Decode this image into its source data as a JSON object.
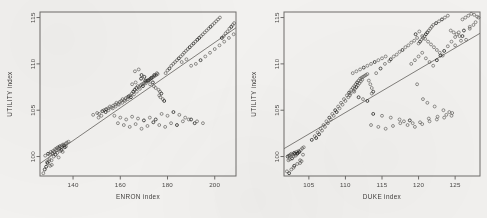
{
  "figure": {
    "background_color": "#f2f1ef",
    "point_color": "#55534f",
    "line_color": "#63615d",
    "axis_color": "#6e6c6a",
    "panel_count": 2
  },
  "chart_data": [
    {
      "type": "scatter",
      "panel": "left",
      "title": "",
      "xlabel": "ENRON index",
      "ylabel": "UTILITY index",
      "xlim": [
        126,
        209
      ],
      "ylim": [
        97.9,
        115.6
      ],
      "xticks": [
        140,
        160,
        180,
        200
      ],
      "xticklabels": [
        "140",
        "160",
        "180",
        "200"
      ],
      "yticks": [
        100,
        105,
        110,
        115
      ],
      "yticklabels": [
        "100",
        "105",
        "110",
        "115"
      ],
      "grid": false,
      "legend": "none",
      "annotations": [],
      "fit_line": {
        "x": [
          126,
          209
        ],
        "y": [
          99.25,
          113.9
        ]
      },
      "x": [
        128.2,
        129.4,
        130.1,
        130.6,
        131.2,
        131.5,
        132.0,
        132.4,
        132.8,
        133.1,
        133.6,
        134.0,
        134.4,
        134.9,
        135.3,
        135.8,
        136.2,
        136.9,
        137.4,
        138.1,
        129.0,
        129.8,
        130.9,
        131.8,
        132.6,
        133.3,
        134.6,
        135.1,
        136.5,
        137.0,
        128.6,
        130.3,
        131.0,
        133.9,
        135.6,
        127.4,
        128.0,
        129.2,
        130.0,
        131.4,
        148.5,
        150.2,
        151.0,
        152.4,
        153.1,
        154.0,
        154.8,
        155.6,
        156.2,
        157.0,
        157.8,
        158.4,
        159.1,
        159.8,
        160.4,
        161.0,
        161.7,
        162.3,
        163.0,
        163.6,
        150.8,
        152.0,
        153.8,
        155.0,
        156.8,
        158.0,
        159.4,
        160.8,
        162.0,
        163.2,
        164.2,
        164.9,
        165.5,
        166.1,
        166.8,
        167.4,
        168.0,
        168.6,
        169.2,
        169.9,
        170.4,
        171.0,
        171.6,
        172.2,
        172.8,
        173.4,
        174.0,
        174.6,
        175.2,
        175.8,
        164.5,
        165.8,
        167.0,
        168.3,
        169.6,
        170.8,
        172.0,
        173.2,
        174.4,
        175.5,
        165.0,
        166.5,
        168.8,
        170.2,
        171.4,
        173.8,
        175.0,
        176.2,
        176.8,
        177.4,
        166.2,
        167.8,
        169.0,
        170.6,
        172.6,
        174.2,
        176.5,
        177.0,
        178.0,
        178.6,
        179.2,
        180.0,
        180.8,
        181.6,
        182.4,
        183.2,
        184.0,
        184.8,
        185.6,
        186.4,
        187.0,
        187.8,
        188.6,
        189.4,
        190.2,
        191.0,
        191.8,
        192.6,
        193.4,
        194.2,
        195.0,
        195.8,
        196.6,
        197.4,
        198.2,
        199.0,
        199.8,
        200.6,
        201.4,
        202.2,
        203.0,
        203.8,
        204.6,
        205.4,
        206.2,
        207.0,
        207.6,
        208.2,
        186.0,
        188.0,
        190.0,
        192.0,
        194.0,
        196.0,
        198.0,
        200.0,
        202.0,
        204.0,
        206.0,
        208.0,
        159.0,
        161.5,
        164.0,
        166.5,
        169.0,
        171.5,
        174.0,
        176.5,
        179.0,
        181.5,
        184.0,
        186.5,
        189.0,
        191.5,
        157.5,
        160.0,
        162.5,
        165.0,
        167.5,
        170.0,
        172.5,
        175.0,
        177.5,
        180.0,
        182.5,
        185.0,
        187.5,
        190.0,
        192.5,
        195.0
      ],
      "y": [
        100.1,
        100.3,
        100.2,
        100.5,
        100.4,
        100.6,
        100.5,
        100.8,
        100.7,
        100.9,
        101.0,
        100.9,
        101.1,
        101.0,
        101.2,
        101.3,
        101.2,
        101.4,
        101.5,
        101.6,
        99.4,
        99.5,
        99.6,
        100.0,
        100.2,
        100.4,
        100.6,
        100.7,
        101.0,
        101.1,
        98.9,
        99.0,
        99.1,
        99.9,
        100.5,
        98.2,
        98.6,
        99.3,
        99.7,
        100.3,
        104.5,
        104.7,
        104.6,
        104.9,
        105.0,
        105.1,
        105.2,
        105.4,
        105.3,
        105.5,
        105.6,
        105.8,
        105.7,
        105.9,
        106.0,
        106.2,
        106.1,
        106.3,
        106.4,
        106.5,
        104.2,
        104.4,
        104.8,
        105.0,
        105.2,
        105.4,
        105.6,
        105.8,
        106.0,
        106.2,
        106.6,
        106.8,
        107.0,
        107.2,
        107.4,
        107.6,
        107.5,
        107.7,
        107.8,
        107.9,
        108.0,
        108.1,
        108.2,
        108.3,
        108.4,
        108.5,
        108.6,
        108.7,
        108.8,
        108.9,
        106.4,
        106.7,
        107.0,
        107.3,
        107.6,
        107.9,
        108.2,
        108.5,
        108.8,
        109.0,
        107.8,
        108.0,
        108.4,
        108.6,
        108.2,
        108.0,
        107.4,
        107.2,
        107.0,
        106.8,
        109.2,
        109.4,
        108.8,
        108.2,
        107.8,
        107.6,
        106.6,
        106.4,
        106.2,
        106.0,
        109.0,
        109.3,
        109.5,
        109.8,
        110.0,
        110.2,
        110.4,
        110.6,
        110.8,
        111.0,
        111.2,
        111.4,
        111.6,
        111.8,
        112.0,
        112.2,
        112.4,
        112.6,
        112.8,
        113.0,
        113.2,
        113.4,
        113.6,
        113.8,
        114.0,
        114.2,
        114.4,
        114.6,
        114.8,
        115.0,
        112.8,
        113.0,
        113.3,
        113.5,
        113.8,
        114.0,
        114.2,
        114.4,
        110.2,
        110.5,
        109.8,
        110.0,
        110.4,
        110.8,
        111.2,
        111.6,
        112.0,
        112.4,
        112.8,
        113.2,
        103.6,
        103.4,
        103.2,
        103.5,
        103.0,
        103.3,
        103.7,
        103.4,
        103.2,
        103.6,
        103.4,
        103.8,
        104.0,
        103.6,
        104.4,
        104.2,
        104.0,
        104.3,
        104.1,
        103.9,
        104.2,
        104.0,
        104.6,
        104.4,
        104.8,
        104.5,
        104.2,
        104.0,
        103.8,
        103.6
      ]
    },
    {
      "type": "scatter",
      "panel": "right",
      "title": "",
      "xlabel": "DUKE index",
      "ylabel": "UTILITY index",
      "xlim": [
        101.6,
        128.4
      ],
      "ylim": [
        97.9,
        115.6
      ],
      "xticks": [
        105,
        110,
        115,
        120,
        125
      ],
      "xticklabels": [
        "105",
        "110",
        "115",
        "120",
        "125"
      ],
      "yticks": [
        100,
        105,
        110,
        115
      ],
      "yticklabels": [
        "100",
        "105",
        "110",
        "115"
      ],
      "grid": false,
      "legend": "none",
      "annotations": [],
      "fit_line": {
        "x": [
          101.6,
          128.4
        ],
        "y": [
          100.85,
          113.3
        ]
      },
      "x": [
        102.1,
        102.3,
        102.5,
        102.6,
        102.8,
        103.0,
        103.1,
        103.3,
        103.5,
        103.6,
        102.2,
        102.4,
        102.7,
        102.9,
        103.2,
        103.4,
        103.7,
        103.9,
        104.1,
        104.3,
        102.0,
        102.6,
        103.0,
        103.8,
        104.0,
        102.3,
        102.9,
        103.4,
        103.8,
        104.2,
        105.4,
        105.8,
        106.2,
        106.6,
        107.0,
        107.4,
        107.8,
        108.2,
        108.6,
        109.0,
        106.0,
        106.4,
        106.8,
        107.2,
        107.6,
        108.0,
        108.4,
        108.8,
        109.2,
        109.6,
        109.4,
        109.8,
        110.2,
        110.5,
        110.8,
        111.0,
        111.2,
        111.4,
        111.6,
        111.8,
        110.0,
        110.4,
        110.7,
        111.1,
        111.3,
        111.5,
        111.7,
        111.9,
        112.1,
        112.3,
        112.0,
        112.2,
        112.4,
        112.6,
        112.8,
        113.0,
        113.2,
        113.4,
        113.6,
        113.8,
        111.0,
        111.5,
        112.0,
        112.5,
        113.0,
        113.5,
        114.0,
        114.5,
        115.0,
        115.5,
        110.6,
        111.2,
        111.8,
        112.4,
        113.0,
        113.6,
        114.2,
        114.8,
        115.4,
        116.0,
        116.2,
        116.6,
        117.0,
        117.4,
        117.8,
        118.2,
        118.6,
        119.0,
        119.4,
        119.8,
        120.0,
        120.2,
        120.4,
        120.6,
        120.8,
        121.0,
        121.2,
        121.4,
        121.6,
        121.8,
        119.6,
        120.1,
        120.5,
        120.9,
        121.3,
        121.7,
        122.1,
        122.5,
        122.9,
        123.3,
        122.0,
        122.4,
        122.8,
        123.2,
        123.6,
        124.0,
        124.4,
        124.8,
        125.2,
        125.6,
        126.0,
        126.4,
        126.8,
        127.2,
        127.6,
        128.0,
        127.0,
        127.8,
        125.0,
        125.8,
        119.0,
        119.5,
        120.0,
        120.5,
        121.0,
        121.5,
        122.0,
        122.5,
        123.0,
        123.5,
        124.0,
        124.5,
        125.0,
        125.5,
        126.0,
        126.5,
        127.0,
        127.5,
        128.2,
        126.2,
        113.5,
        114.5,
        115.5,
        116.5,
        117.5,
        118.5,
        119.5,
        120.5,
        121.5,
        122.5,
        123.5,
        124.5,
        118.0,
        119.2,
        113.8,
        115.0,
        116.2,
        117.4,
        118.8,
        120.2,
        121.4,
        122.6,
        123.8,
        124.6,
        119.8,
        120.6,
        121.2,
        122.2,
        123.4,
        124.2
      ],
      "y": [
        100.0,
        100.1,
        100.2,
        100.3,
        100.2,
        100.4,
        100.3,
        100.5,
        100.4,
        100.6,
        99.6,
        99.7,
        99.8,
        100.0,
        100.1,
        100.3,
        100.5,
        100.7,
        100.9,
        101.0,
        98.4,
        98.6,
        99.0,
        99.3,
        99.5,
        98.2,
        98.8,
        99.2,
        99.6,
        100.2,
        101.8,
        102.2,
        102.6,
        103.0,
        103.4,
        103.8,
        104.2,
        104.6,
        105.0,
        105.4,
        102.0,
        102.4,
        102.8,
        103.2,
        103.6,
        104.0,
        104.4,
        104.8,
        105.2,
        105.6,
        105.8,
        106.2,
        106.6,
        106.9,
        107.2,
        107.4,
        107.6,
        107.8,
        108.0,
        108.2,
        106.0,
        106.4,
        106.8,
        107.1,
        107.3,
        107.5,
        107.7,
        107.9,
        108.1,
        108.3,
        108.4,
        108.5,
        108.6,
        108.7,
        108.8,
        108.9,
        108.2,
        107.8,
        107.4,
        107.0,
        109.0,
        109.2,
        109.4,
        109.6,
        109.8,
        110.0,
        110.2,
        110.4,
        110.6,
        110.8,
        106.6,
        107.0,
        106.4,
        106.2,
        106.0,
        106.8,
        109.0,
        109.5,
        110.0,
        110.3,
        110.5,
        110.8,
        111.0,
        111.3,
        111.5,
        111.8,
        112.0,
        112.3,
        112.5,
        112.8,
        112.2,
        112.4,
        112.6,
        112.8,
        113.0,
        113.2,
        113.4,
        113.6,
        113.8,
        114.0,
        113.2,
        113.5,
        113.0,
        112.7,
        112.4,
        112.1,
        111.8,
        111.5,
        111.2,
        110.9,
        114.2,
        114.4,
        114.6,
        114.8,
        115.0,
        115.2,
        113.6,
        113.4,
        113.2,
        113.0,
        114.8,
        115.0,
        115.2,
        115.4,
        115.3,
        115.1,
        114.0,
        114.5,
        112.0,
        112.5,
        110.0,
        110.4,
        110.8,
        111.2,
        110.6,
        110.2,
        109.8,
        110.4,
        110.9,
        111.4,
        111.9,
        112.4,
        112.9,
        113.4,
        113.0,
        112.6,
        113.8,
        114.2,
        115.0,
        113.6,
        103.4,
        103.2,
        103.0,
        103.3,
        103.6,
        103.4,
        103.2,
        103.5,
        103.8,
        104.0,
        104.2,
        104.4,
        103.8,
        103.6,
        104.6,
        104.4,
        104.2,
        104.0,
        103.9,
        103.7,
        104.1,
        104.3,
        104.5,
        104.7,
        107.8,
        106.2,
        105.8,
        105.4,
        105.0,
        104.8
      ]
    }
  ]
}
